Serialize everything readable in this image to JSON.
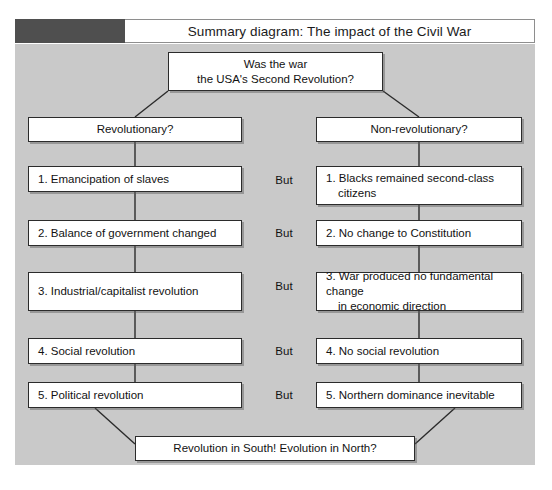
{
  "title": {
    "text": "Summary diagram: The impact of the Civil War",
    "swatch_color": "#4f4f4f"
  },
  "panel": {
    "background_color": "#c9c9c9",
    "box_color": "#ffffff",
    "border_color": "#2b2b2b"
  },
  "diagram": {
    "question": {
      "line1": "Was the war",
      "line2": "the USA's Second Revolution?"
    },
    "columns": {
      "left_header": "Revolutionary?",
      "right_header": "Non-revolutionary?"
    },
    "connector_label": "But",
    "left_items": [
      {
        "line1": "1. Emancipation of slaves",
        "line2": ""
      },
      {
        "line1": "2. Balance of government changed",
        "line2": ""
      },
      {
        "line1": "3. Industrial/capitalist revolution",
        "line2": ""
      },
      {
        "line1": "4. Social revolution",
        "line2": ""
      },
      {
        "line1": "5. Political revolution",
        "line2": ""
      }
    ],
    "right_items": [
      {
        "line1": "1. Blacks remained second-class",
        "line2": "citizens"
      },
      {
        "line1": "2. No change to Constitution",
        "line2": ""
      },
      {
        "line1": "3. War produced no fundamental change",
        "line2": "in economic direction"
      },
      {
        "line1": "4. No social revolution",
        "line2": ""
      },
      {
        "line1": "5. Northern dominance inevitable",
        "line2": ""
      }
    ],
    "conclusion": "Revolution in South! Evolution in North?"
  }
}
